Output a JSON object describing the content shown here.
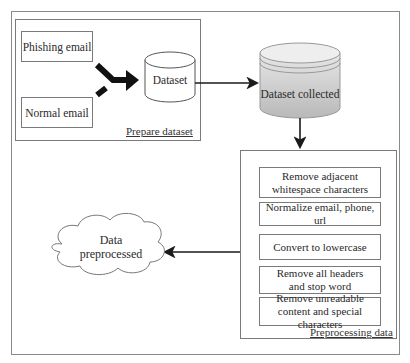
{
  "diagram": {
    "prepare_dataset": {
      "caption": "Prepare dataset",
      "inputs": [
        "Phishing email",
        "Normal email"
      ],
      "dataset_label": "Dataset"
    },
    "dataset_collected": {
      "label": "Dataset collected",
      "fill_color": "#cdcdcd"
    },
    "preprocessing": {
      "caption": "Preprocessing data",
      "steps": [
        "Remove adjacent whitespace characters",
        "Normalize email, phone, url",
        "Convert to lowercase",
        "Remove all headers and stop word",
        "Remove unreadable content and special characters"
      ]
    },
    "output": {
      "label_line1": "Data",
      "label_line2": "preprocessed"
    }
  }
}
